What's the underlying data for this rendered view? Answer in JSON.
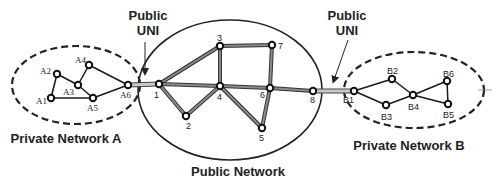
{
  "diagram": {
    "regions": {
      "private_a": {
        "label": "Private Network A",
        "cx": 76,
        "cy": 85,
        "rx": 64,
        "ry": 39,
        "style": "dashed",
        "label_x": 66,
        "label_y": 143
      },
      "public": {
        "label": "Public Network",
        "cx": 230,
        "cy": 90,
        "rx": 92,
        "ry": 70,
        "style": "solid",
        "label_x": 238,
        "label_y": 176
      },
      "private_b": {
        "label": "Private Network B",
        "cx": 414,
        "cy": 90,
        "rx": 70,
        "ry": 38,
        "style": "dashed",
        "label_x": 409,
        "label_y": 150
      }
    },
    "uni_labels": [
      {
        "line1": "Public",
        "line2": "UNI",
        "x": 148,
        "y1": 20,
        "y2": 35,
        "arrow_from": [
          145,
          42
        ],
        "arrow_to": [
          145,
          72
        ]
      },
      {
        "line1": "Public",
        "line2": "UNI",
        "x": 347,
        "y1": 20,
        "y2": 35,
        "arrow_from": [
          348,
          40
        ],
        "arrow_to": [
          334,
          80
        ]
      }
    ],
    "nodes": [
      {
        "id": "A1",
        "x": 51,
        "y": 98,
        "lx": 36,
        "ly": 104,
        "font": "serif"
      },
      {
        "id": "A2",
        "x": 57,
        "y": 74,
        "lx": 40,
        "ly": 74,
        "font": "serif"
      },
      {
        "id": "A3",
        "x": 78,
        "y": 85,
        "lx": 63,
        "ly": 95,
        "font": "serif"
      },
      {
        "id": "A4",
        "x": 89,
        "y": 65,
        "lx": 75,
        "ly": 63,
        "font": "serif"
      },
      {
        "id": "A5",
        "x": 93,
        "y": 98,
        "lx": 87,
        "ly": 111,
        "font": "serif"
      },
      {
        "id": "A6",
        "x": 128,
        "y": 85,
        "lx": 120,
        "ly": 98,
        "font": "serif"
      },
      {
        "id": "1",
        "x": 159,
        "y": 84,
        "lx": 154,
        "ly": 98,
        "font": "sans"
      },
      {
        "id": "2",
        "x": 186,
        "y": 116,
        "lx": 186,
        "ly": 129,
        "font": "sans"
      },
      {
        "id": "3",
        "x": 220,
        "y": 46,
        "lx": 217,
        "ly": 41,
        "font": "sans"
      },
      {
        "id": "4",
        "x": 220,
        "y": 86,
        "lx": 217,
        "ly": 100,
        "font": "sans"
      },
      {
        "id": "5",
        "x": 262,
        "y": 128,
        "lx": 259,
        "ly": 141,
        "font": "sans"
      },
      {
        "id": "6",
        "x": 270,
        "y": 88,
        "lx": 260,
        "ly": 98,
        "font": "sans"
      },
      {
        "id": "7",
        "x": 272,
        "y": 45,
        "lx": 278,
        "ly": 49,
        "font": "sans"
      },
      {
        "id": "8",
        "x": 313,
        "y": 91,
        "lx": 310,
        "ly": 103,
        "font": "sans"
      },
      {
        "id": "B1",
        "x": 354,
        "y": 91,
        "lx": 343,
        "ly": 103,
        "font": "sans"
      },
      {
        "id": "B2",
        "x": 392,
        "y": 79,
        "lx": 387,
        "ly": 74,
        "font": "sans"
      },
      {
        "id": "B3",
        "x": 386,
        "y": 105,
        "lx": 381,
        "ly": 120,
        "font": "sans"
      },
      {
        "id": "B4",
        "x": 413,
        "y": 95,
        "lx": 408,
        "ly": 110,
        "font": "sans"
      },
      {
        "id": "B5",
        "x": 448,
        "y": 104,
        "lx": 443,
        "ly": 118,
        "font": "sans"
      },
      {
        "id": "B6",
        "x": 447,
        "y": 81,
        "lx": 443,
        "ly": 77,
        "font": "sans"
      }
    ],
    "private_edges": [
      [
        "A1",
        "A2"
      ],
      [
        "A2",
        "A3"
      ],
      [
        "A3",
        "A4"
      ],
      [
        "A3",
        "A5"
      ],
      [
        "A1",
        "A5"
      ],
      [
        "A4",
        "A6"
      ],
      [
        "A5",
        "A6"
      ],
      [
        "B1",
        "B2"
      ],
      [
        "B1",
        "B3"
      ],
      [
        "B2",
        "B4"
      ],
      [
        "B3",
        "B4"
      ],
      [
        "B4",
        "B6"
      ],
      [
        "B4",
        "B5"
      ],
      [
        "B5",
        "B6"
      ]
    ],
    "public_edges": [
      [
        "1",
        "3"
      ],
      [
        "1",
        "4"
      ],
      [
        "1",
        "2"
      ],
      [
        "2",
        "4"
      ],
      [
        "3",
        "4"
      ],
      [
        "3",
        "7"
      ],
      [
        "4",
        "6"
      ],
      [
        "4",
        "5"
      ],
      [
        "5",
        "6"
      ],
      [
        "6",
        "7"
      ],
      [
        "6",
        "8"
      ]
    ],
    "uni_links": [
      [
        "A6",
        "1"
      ],
      [
        "8",
        "B1"
      ]
    ],
    "colors": {
      "private_edge": "#1a1a1a",
      "public_edge_outer": "#333333",
      "public_edge_inner": "#8a8a8a",
      "uni_outer": "#444444",
      "uni_inner": "#c8c8c8",
      "node_stroke": "#111111",
      "node_fill": "#ffffff",
      "region_stroke": "#222222"
    }
  }
}
